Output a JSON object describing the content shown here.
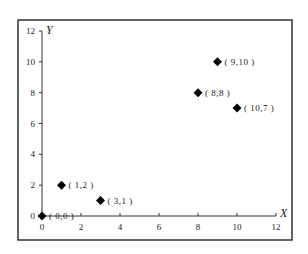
{
  "chart_data": {
    "type": "scatter",
    "title": "",
    "xlabel": "X",
    "ylabel": "Y",
    "xlim": [
      0,
      12
    ],
    "ylim": [
      0,
      12
    ],
    "xticks": [
      0,
      2,
      4,
      6,
      8,
      10,
      12
    ],
    "yticks": [
      0,
      2,
      4,
      6,
      8,
      10,
      12
    ],
    "grid": false,
    "legend": null,
    "marker": "diamond",
    "marker_color": "#000000",
    "points": [
      {
        "x": 0,
        "y": 0,
        "label": "( 0,0 )"
      },
      {
        "x": 1,
        "y": 2,
        "label": "( 1,2 )"
      },
      {
        "x": 3,
        "y": 1,
        "label": "( 3,1 )"
      },
      {
        "x": 8,
        "y": 8,
        "label": "( 8,8 )"
      },
      {
        "x": 9,
        "y": 10,
        "label": "( 9,10 )"
      },
      {
        "x": 10,
        "y": 7,
        "label": "( 10,7 )"
      }
    ]
  }
}
